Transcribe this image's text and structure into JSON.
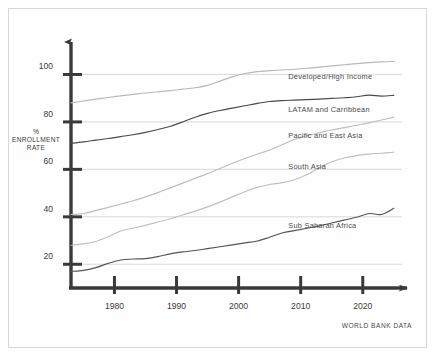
{
  "chart_data": {
    "type": "line",
    "title": "",
    "subtitle": "",
    "xlabel": "",
    "ylabel": "% ENROLLMENT RATE",
    "ylabel_lines": [
      "%",
      "ENROLLMENT",
      "RATE"
    ],
    "source_note": "WORLD BANK DATA",
    "grid": true,
    "legend_position": "inline-right-of-line",
    "xlim": [
      1973,
      2026
    ],
    "ylim": [
      10,
      112
    ],
    "xticks": [
      1980,
      1990,
      2000,
      2010,
      2020
    ],
    "xtick_labels": [
      "1980",
      "1990",
      "2000",
      "2010",
      "2020"
    ],
    "yticks": [
      20,
      40,
      60,
      80,
      100
    ],
    "ytick_labels": [
      "20",
      "40",
      "60",
      "80",
      "100"
    ],
    "x": [
      1973,
      1975,
      1977,
      1979,
      1981,
      1983,
      1985,
      1987,
      1989,
      1991,
      1993,
      1995,
      1997,
      1999,
      2001,
      2003,
      2005,
      2007,
      2009,
      2011,
      2013,
      2015,
      2017,
      2019,
      2021,
      2023,
      2025
    ],
    "series": [
      {
        "name": "Developed/High Income",
        "color": "#b9b9b9",
        "label_x": 2008,
        "label_y": 99,
        "values": [
          88.0,
          88.8,
          89.6,
          90.3,
          91.0,
          91.6,
          92.2,
          92.7,
          93.2,
          93.8,
          94.4,
          95.4,
          97.2,
          99.0,
          100.4,
          101.2,
          101.6,
          101.9,
          102.2,
          102.6,
          103.1,
          103.6,
          104.1,
          104.6,
          105.0,
          105.3,
          105.5
        ]
      },
      {
        "name": "LATAM and Carribbean",
        "color": "#4a4a4a",
        "label_x": 2008,
        "label_y": 85,
        "values": [
          71.0,
          71.6,
          72.3,
          73.0,
          73.8,
          74.6,
          75.6,
          76.8,
          78.2,
          80.0,
          82.0,
          83.6,
          84.8,
          85.8,
          86.8,
          87.8,
          88.6,
          89.0,
          89.2,
          89.4,
          89.6,
          89.9,
          90.2,
          90.6,
          91.3,
          90.9,
          91.2
        ]
      },
      {
        "name": "Pacific and East Asia",
        "color": "#bdbdbd",
        "label_x": 2008,
        "label_y": 74,
        "values": [
          41.0,
          41.4,
          42.6,
          44.0,
          45.4,
          46.8,
          48.4,
          50.2,
          52.2,
          54.2,
          56.2,
          58.2,
          60.4,
          62.6,
          64.6,
          66.4,
          68.2,
          70.4,
          72.6,
          74.2,
          75.4,
          76.6,
          77.6,
          78.6,
          79.6,
          80.8,
          82.0
        ]
      },
      {
        "name": "South Asia",
        "color": "#c0c0c0",
        "label_x": 2008,
        "label_y": 61,
        "values": [
          28.0,
          28.6,
          29.6,
          31.6,
          34.0,
          35.2,
          36.4,
          37.8,
          39.2,
          40.8,
          42.4,
          44.2,
          46.2,
          48.4,
          50.6,
          52.4,
          53.6,
          54.4,
          55.6,
          57.8,
          60.6,
          63.2,
          64.8,
          65.8,
          66.4,
          66.8,
          67.2
        ]
      },
      {
        "name": "Sub Saharan Africa",
        "color": "#555555",
        "label_x": 2008,
        "label_y": 36,
        "values": [
          17.0,
          17.4,
          18.6,
          20.4,
          21.8,
          22.2,
          22.4,
          23.2,
          24.4,
          25.2,
          25.8,
          26.6,
          27.4,
          28.2,
          29.0,
          29.8,
          31.4,
          33.2,
          34.2,
          35.2,
          36.2,
          37.4,
          38.6,
          39.8,
          41.4,
          41.0,
          43.6
        ]
      }
    ]
  },
  "axis": {
    "y_arrow": "up-arrow",
    "x_arrow": "right-arrow"
  }
}
